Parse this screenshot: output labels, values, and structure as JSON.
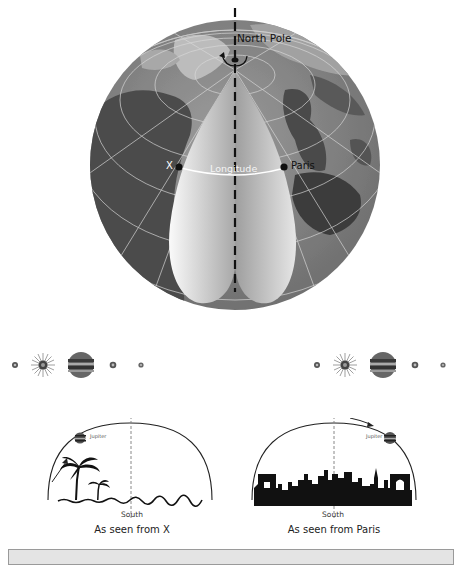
{
  "globe": {
    "north_pole_label": "North Pole",
    "point_x_label": "X",
    "point_paris_label": "Paris",
    "longitude_label": "Longitude",
    "colors": {
      "ocean": "#8a8a8a",
      "land": "#b4b4b4",
      "dark_land": "#4a4a4a",
      "cone_light": "#f2f2f2",
      "cone_dark": "#9a9a9a",
      "axis": "#111111"
    }
  },
  "planet_rows": [
    {
      "side": "left",
      "bodies": [
        "moon-io",
        "sun-flare",
        "jupiter",
        "moon-europa",
        "moon-callisto"
      ]
    },
    {
      "side": "right",
      "bodies": [
        "moon-io",
        "sun-flare",
        "jupiter",
        "moon-europa",
        "moon-callisto"
      ]
    }
  ],
  "sky_views": [
    {
      "id": "x",
      "jupiter_label": "Jupiter",
      "south_label": "South",
      "caption": "As seen from X",
      "scenery": "palm-trees"
    },
    {
      "id": "paris",
      "jupiter_label": "Jupiter",
      "south_label": "South",
      "caption": "As seen from Paris",
      "scenery": "paris-skyline"
    }
  ]
}
